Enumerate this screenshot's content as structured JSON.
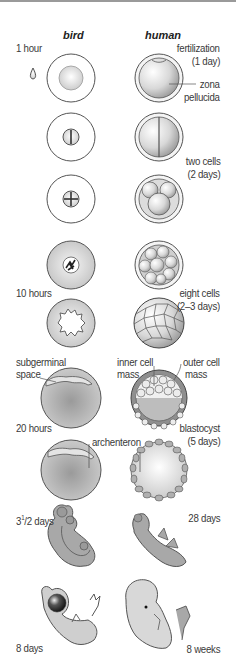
{
  "diagram": {
    "columns": {
      "bird": "bird",
      "human": "human"
    },
    "bird_labels": {
      "t1": "1 hour",
      "t2": "10 hours",
      "subgerminal_1": "subgerminal",
      "subgerminal_2": "space",
      "t3": "20 hours",
      "archenteron": "archenteron",
      "t4_main": "3",
      "t4_sup": "1",
      "t4_rest": "/2 days",
      "t5": "8 days"
    },
    "human_labels": {
      "fert_1": "fertilization",
      "fert_2": "(1 day)",
      "zona_1": "zona",
      "zona_2": "pellucida",
      "two_1": "two cells",
      "two_2": "(2 days)",
      "eight_1": "eight cells",
      "eight_2": "(2–3 days)",
      "inner_1": "inner cell",
      "inner_2": "mass",
      "outer_1": "outer cell",
      "outer_2": "mass",
      "blast_1": "blastocyst",
      "blast_2": "(5 days)",
      "d28": "28 days",
      "w8": "8 weeks"
    },
    "colors": {
      "outline": "#555555",
      "shade_light": "#e6e6e6",
      "shade_mid": "#b9b9b9",
      "shade_dark": "#8c8c8c"
    }
  }
}
